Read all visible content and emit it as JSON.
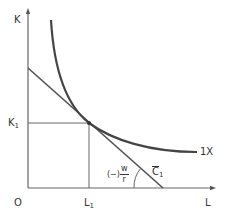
{
  "diagram": {
    "axes": {
      "y_label": "K",
      "x_label": "L",
      "origin_label": "O"
    },
    "markers": {
      "k1_main": "K",
      "k1_sub": "1",
      "l1_main": "L",
      "l1_sub": "1"
    },
    "curve": {
      "label": "1X"
    },
    "budget_line": {
      "label_main": "C",
      "label_sub": "1"
    },
    "slope": {
      "prefix": "(−)",
      "numerator": "w",
      "denominator": "r"
    },
    "colors": {
      "axis": "#666666",
      "curve": "#444444",
      "budget_line": "#555555",
      "guide": "#666666",
      "text": "#333333"
    }
  }
}
